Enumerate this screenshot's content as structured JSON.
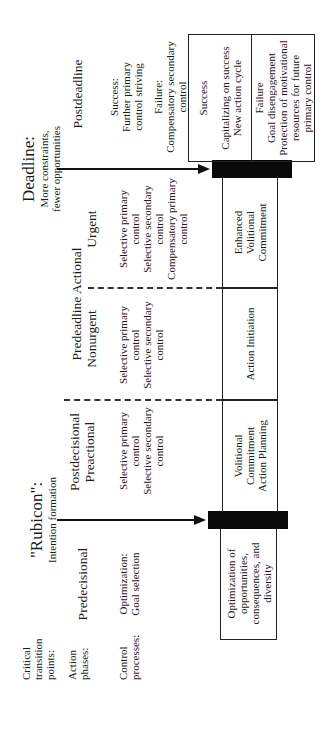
{
  "row_labels": {
    "critical": "Critical transition points:",
    "phases": "Action phases:",
    "control": "Control processes:"
  },
  "transitions": {
    "rubicon": {
      "title": "\"Rubicon\":",
      "subtitle": "Intention formation"
    },
    "deadline": {
      "title": "Deadline:",
      "subtitle_1": "More constraints,",
      "subtitle_2": "fewer opportunities"
    }
  },
  "phases": {
    "predecisional": "Predecisional",
    "postdecisional_1": "Postdecisional",
    "postdecisional_2": "Preactional",
    "predeadline_actional": "Predeadline Actional",
    "nonurgent": "Nonurgent",
    "urgent": "Urgent",
    "postdeadline": "Postdeadline"
  },
  "control_processes": {
    "predecisional": [
      "Optimization:",
      "Goal selection"
    ],
    "postdecisional": [
      "Selective primary",
      "control",
      "Selective secondary",
      "control"
    ],
    "nonurgent": [
      "Selective primary",
      "control",
      "Selective secondary",
      "control"
    ],
    "urgent": [
      "Selective primary",
      "control",
      "Selective secondary",
      "control",
      "Compensatory primary",
      "control"
    ],
    "postdeadline": [
      "Success:",
      "Further primary",
      "control striving",
      "Failure:",
      "Compensatory secondary",
      "control"
    ]
  },
  "boxes": {
    "optimization": [
      "Optimization of",
      "opportunities,",
      "consequences, and",
      "diversity"
    ],
    "volitional": [
      "Volitional",
      "Commitment",
      "Action Planning"
    ],
    "action_initiation": [
      "Action Initiation"
    ],
    "enhanced": [
      "Enhanced",
      "Volitional",
      "Commitment"
    ],
    "success": [
      "Success",
      "",
      "Capitalizing on success",
      "New action cycle"
    ],
    "failure": [
      "Failure",
      "Goal disengagement",
      "Protection of motivational",
      "resources for future",
      "primary control"
    ]
  }
}
